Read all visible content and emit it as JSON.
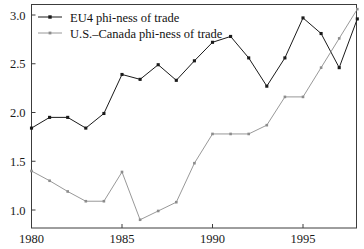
{
  "chart_data": {
    "type": "line",
    "title": "",
    "subtitle": "",
    "xlabel": "",
    "ylabel": "",
    "xlim": [
      1980,
      1998
    ],
    "ylim": [
      0.87,
      3.12
    ],
    "xticks": [
      1980,
      1985,
      1990,
      1995
    ],
    "xtick_labels": [
      "1980",
      "1985",
      "1990",
      "1995"
    ],
    "yticks": [
      1.0,
      1.5,
      2.0,
      2.5,
      3.0
    ],
    "ytick_labels": [
      "1.0",
      "1.5",
      "2.0",
      "2.5",
      "3.0"
    ],
    "grid": false,
    "legend_position": "top-left",
    "x": [
      1980,
      1981,
      1982,
      1983,
      1984,
      1985,
      1986,
      1987,
      1988,
      1989,
      1990,
      1991,
      1992,
      1993,
      1994,
      1995,
      1996,
      1997,
      1998
    ],
    "series": [
      {
        "name": "EU4 phi-ness of trade",
        "color": "#1a1a1a",
        "marker": "square",
        "values": [
          1.84,
          1.95,
          1.95,
          1.84,
          1.99,
          2.39,
          2.34,
          2.49,
          2.33,
          2.53,
          2.72,
          2.78,
          2.56,
          2.27,
          2.56,
          2.97,
          2.81,
          2.46,
          2.96
        ]
      },
      {
        "name": "U.S.–Canada phi-ness of trade",
        "color": "#8c8c8c",
        "marker": "square",
        "values": [
          1.4,
          1.3,
          1.19,
          1.09,
          1.09,
          1.39,
          0.9,
          0.99,
          1.08,
          1.48,
          1.78,
          1.78,
          1.78,
          1.87,
          2.16,
          2.16,
          2.46,
          2.76,
          3.06
        ]
      }
    ]
  },
  "legend": {
    "entries": [
      {
        "label": "EU4 phi-ness of trade"
      },
      {
        "label": "U.S.–Canada phi-ness of trade"
      }
    ]
  },
  "colors": {
    "series_eu4": "#1a1a1a",
    "series_us_canada": "#8c8c8c",
    "axis": "#3c3c3c",
    "background": "#ffffff"
  }
}
